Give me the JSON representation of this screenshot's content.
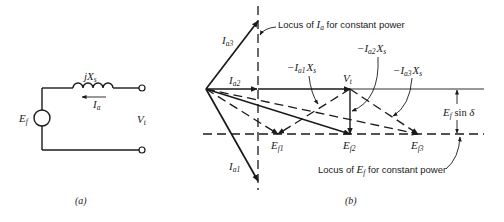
{
  "figure": {
    "panel_a": {
      "caption": "(a)",
      "reactance": {
        "main": "jX",
        "sub": "s"
      },
      "current": {
        "main": "I",
        "sub": "a"
      },
      "source": {
        "main": "E",
        "sub": "f"
      },
      "terminal": {
        "main": "V",
        "sub": "t"
      }
    },
    "panel_b": {
      "caption": "(b)",
      "currents": [
        {
          "main": "I",
          "sub": "a3"
        },
        {
          "main": "I",
          "sub": "a2"
        },
        {
          "main": "I",
          "sub": "a1"
        }
      ],
      "terminal_voltage": {
        "main": "V",
        "sub": "t"
      },
      "emfs": [
        {
          "main": "E",
          "sub": "f1"
        },
        {
          "main": "E",
          "sub": "f2"
        },
        {
          "main": "E",
          "sub": "f3"
        }
      ],
      "drops": [
        {
          "prefix": "−I",
          "sub1": "a1",
          "main2": "X",
          "sub2": "s"
        },
        {
          "prefix": "−I",
          "sub1": "a2",
          "main2": "X",
          "sub2": "s"
        },
        {
          "prefix": "−I",
          "sub1": "a3",
          "main2": "X",
          "sub2": "s"
        }
      ],
      "locus_current": {
        "before": "Locus of ",
        "var": "I",
        "sub": "a",
        "after": " for constant power"
      },
      "locus_emf": {
        "before": "Locus of ",
        "var": "E",
        "sub": "f",
        "after": " for constant power"
      },
      "dimension": {
        "var": "E",
        "sub": "f",
        "func": " sin ",
        "angle": "δ"
      }
    }
  }
}
